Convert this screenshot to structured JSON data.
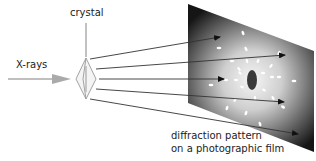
{
  "labels": {
    "crystal": "crystal",
    "xrays": "X-rays",
    "film_line1": "diffraction pattern",
    "film_line2": "on a photographic film"
  },
  "colors": {
    "incident_beam": "#aaaaaa",
    "rays": "#333333",
    "film_dark": "#111111",
    "film_light": "#f4f4f4",
    "spots": "#ffffff",
    "central_spot": "#3a3a3a"
  },
  "icons": {
    "incident_arrow": "arrow-right",
    "crystal": "diamond-crystal",
    "film": "parallelogram-film"
  }
}
